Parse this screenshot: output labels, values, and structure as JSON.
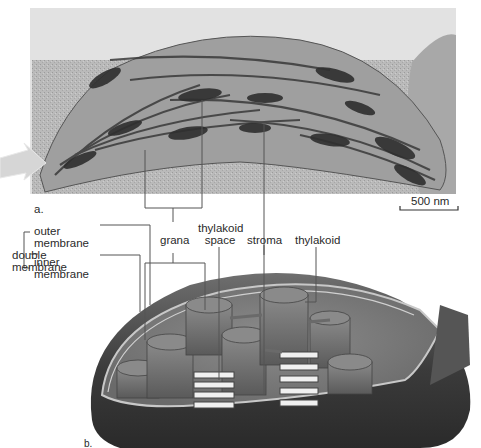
{
  "figure": {
    "panel_a": {
      "label": "a.",
      "type": "electron micrograph of chloroplast",
      "scale_bar": "500 nm"
    },
    "panel_b": {
      "label": "b.",
      "type": "3D cutaway illustration of chloroplast"
    },
    "labels": {
      "double_membrane": [
        "double",
        "membrane"
      ],
      "outer_membrane": [
        "outer",
        "membrane"
      ],
      "inner_membrane": [
        "inner",
        "membrane"
      ],
      "grana": "grana",
      "thylakoid_space": [
        "thylakoid",
        "space"
      ],
      "stroma": "stroma",
      "thylakoid": "thylakoid"
    },
    "colors": {
      "micrograph_bg": "#b9b9b9",
      "micrograph_dark": "#3a3a3a",
      "illustration_outer": "#4a4a4a",
      "illustration_inner": "#7a7a7a",
      "leader_line": "#555555",
      "arrow": "#d8d8d8"
    }
  }
}
